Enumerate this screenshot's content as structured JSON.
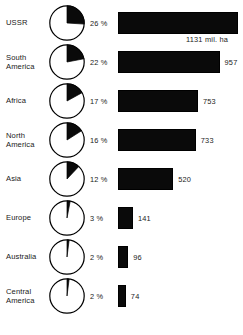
{
  "chart_data": {
    "type": "bar",
    "title": "",
    "xlabel": "",
    "ylabel": "",
    "unit_label": "mil. ha",
    "categories": [
      "USSR",
      "South America",
      "Africa",
      "North America",
      "Asia",
      "Europe",
      "Australia",
      "Central America"
    ],
    "values": [
      1131,
      957,
      753,
      733,
      520,
      141,
      96,
      74
    ],
    "percent_values": [
      26,
      22,
      17,
      16,
      12,
      3,
      2,
      2
    ],
    "value_labels": [
      "1131 mil. ha",
      "957",
      "753",
      "733",
      "520",
      "141",
      "96",
      "74"
    ],
    "percent_labels": [
      "26 %",
      "22 %",
      "17 %",
      "16 %",
      "12 %",
      "3 %",
      "2 %",
      "2 %"
    ],
    "xlim": [
      0,
      1131
    ],
    "grid": false,
    "legend": "none",
    "colors": {
      "bar_fill": "#0a0a0a",
      "pie_wedge": "#0a0a0a",
      "pie_background": "#ffffff",
      "outline": "#000000",
      "text": "#1a1a1a",
      "page_background": "#ffffff"
    }
  },
  "rows": [
    {
      "label_lines": [
        "USSR"
      ],
      "percent": "26 %",
      "value_label": "1131 mil. ha",
      "value": 1131,
      "percent_value": 26
    },
    {
      "label_lines": [
        "South",
        "America"
      ],
      "percent": "22 %",
      "value_label": "957",
      "value": 957,
      "percent_value": 22
    },
    {
      "label_lines": [
        "Africa"
      ],
      "percent": "17 %",
      "value_label": "753",
      "value": 753,
      "percent_value": 17
    },
    {
      "label_lines": [
        "North",
        "America"
      ],
      "percent": "16 %",
      "value_label": "733",
      "value": 733,
      "percent_value": 16
    },
    {
      "label_lines": [
        "Asia"
      ],
      "percent": "12 %",
      "value_label": "520",
      "value": 520,
      "percent_value": 12
    },
    {
      "label_lines": [
        "Europe"
      ],
      "percent": "3 %",
      "value_label": "141",
      "value": 141,
      "percent_value": 3
    },
    {
      "label_lines": [
        "Australia"
      ],
      "percent": "2 %",
      "value_label": "96",
      "value": 96,
      "percent_value": 2
    },
    {
      "label_lines": [
        "Central",
        "America"
      ],
      "percent": "2 %",
      "value_label": "74",
      "value": 74,
      "percent_value": 2
    }
  ],
  "layout": {
    "row_centers": [
      23,
      62,
      101,
      140,
      179,
      218,
      257,
      296
    ],
    "bar_origin_x": 118,
    "bar_scale_px_per_unit": 0.1061,
    "pie_diameter": 38
  }
}
